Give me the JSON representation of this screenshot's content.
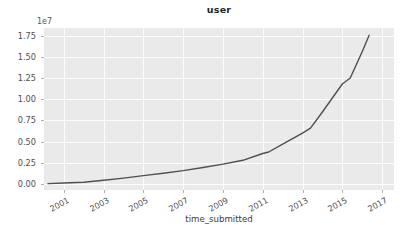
{
  "chart_data": {
    "type": "line",
    "title": "user",
    "xlabel": "time_submitted",
    "ylabel": "",
    "y_offset_text": "1e7",
    "y_scale_factor": 10000000,
    "grid": true,
    "legend": null,
    "xlim": [
      2000.0,
      2017.6
    ],
    "ylim": [
      -0.07,
      1.84
    ],
    "xticks": [
      2001,
      2003,
      2005,
      2007,
      2009,
      2011,
      2013,
      2015,
      2017
    ],
    "xtick_labels": [
      "2001",
      "2003",
      "2005",
      "2007",
      "2009",
      "2011",
      "2013",
      "2015",
      "2017"
    ],
    "yticks": [
      0.0,
      0.25,
      0.5,
      0.75,
      1.0,
      1.25,
      1.5,
      1.75
    ],
    "ytick_labels": [
      "0.00",
      "0.25",
      "0.50",
      "0.75",
      "1.00",
      "1.25",
      "1.50",
      "1.75"
    ],
    "series": [
      {
        "name": "user",
        "color": "#4f4f4f",
        "linewidth": 1.4,
        "x": [
          2000.2,
          2001.0,
          2002.0,
          2003.0,
          2004.0,
          2005.0,
          2006.0,
          2007.0,
          2008.0,
          2009.0,
          2010.0,
          2011.0,
          2011.3,
          2012.0,
          2013.0,
          2013.4,
          2014.0,
          2015.0,
          2015.4,
          2016.0,
          2016.35
        ],
        "y": [
          0.01,
          0.03,
          0.05,
          0.1,
          0.15,
          0.21,
          0.26,
          0.32,
          0.4,
          0.48,
          0.57,
          0.72,
          0.75,
          0.95,
          1.2,
          1.3,
          1.65,
          2.35,
          2.42,
          3.1,
          3.5
        ]
      }
    ],
    "series_values_e7": {
      "note": "y values above are in units of 1e6 display-normalised; true plotted values in 1e7 units",
      "x": [
        2000.2,
        2001.0,
        2002.0,
        2003.0,
        2004.0,
        2005.0,
        2006.0,
        2007.0,
        2008.0,
        2009.0,
        2010.0,
        2011.0,
        2011.3,
        2012.0,
        2013.0,
        2013.4,
        2014.0,
        2015.0,
        2015.4,
        2016.0,
        2016.35
      ],
      "y": [
        0.005,
        0.012,
        0.022,
        0.045,
        0.07,
        0.1,
        0.128,
        0.158,
        0.196,
        0.235,
        0.28,
        0.36,
        0.378,
        0.47,
        0.6,
        0.66,
        0.85,
        1.18,
        1.25,
        1.56,
        1.755
      ]
    }
  },
  "figure": {
    "background_color": "#ffffff",
    "axes_background_color": "#eaeaea",
    "gridline_color": "#fdfdfd",
    "tick_color": "#4d4d4d",
    "line_color": "#4f4f4f"
  }
}
